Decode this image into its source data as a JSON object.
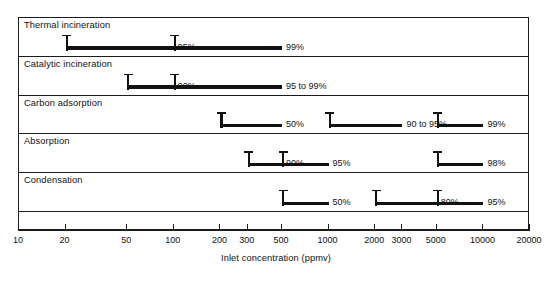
{
  "chart_data": {
    "type": "bar",
    "title": "",
    "xlabel": "Inlet concentration (ppmv)",
    "ylabel": "",
    "scale": "log",
    "xlim": [
      10,
      20000
    ],
    "grid": false,
    "legend": "none",
    "tick_labels": [
      "10",
      "20",
      "50",
      "100",
      "200",
      "300",
      "500",
      "1000",
      "2000",
      "3000",
      "5000",
      "10000",
      "20000"
    ],
    "tick_values": [
      10,
      20,
      50,
      100,
      200,
      300,
      500,
      1000,
      2000,
      3000,
      5000,
      10000,
      20000
    ],
    "categories": [
      "Thermal incineration",
      "Catalytic incineration",
      "Carbon adsorption",
      "Absorption",
      "Condensation"
    ],
    "series": [
      {
        "name": "Thermal incineration",
        "ranges": [
          {
            "label": "95%",
            "start": 20,
            "end": 100
          },
          {
            "label": "99%",
            "start": 100,
            "end": 500
          }
        ]
      },
      {
        "name": "Catalytic incineration",
        "ranges": [
          {
            "label": "90%",
            "start": 50,
            "end": 100
          },
          {
            "label": "95 to 99%",
            "start": 100,
            "end": 500
          }
        ]
      },
      {
        "name": "Carbon adsorption",
        "ranges": [
          {
            "label": "50%",
            "start": 200,
            "end": 500
          },
          {
            "label": "90 to 95%",
            "start": 1000,
            "end": 3000
          },
          {
            "label": "99%",
            "start": 5000,
            "end": 10000
          }
        ]
      },
      {
        "name": "Absorption",
        "ranges": [
          {
            "label": "90%",
            "start": 300,
            "end": 500
          },
          {
            "label": "95%",
            "start": 500,
            "end": 1000
          },
          {
            "label": "98%",
            "start": 5000,
            "end": 10000
          }
        ]
      },
      {
        "name": "Condensation",
        "ranges": [
          {
            "label": "50%",
            "start": 500,
            "end": 1000
          },
          {
            "label": "80%",
            "start": 2000,
            "end": 5000
          },
          {
            "label": "95%",
            "start": 5000,
            "end": 10000
          }
        ]
      }
    ]
  },
  "colors": {
    "line": "#1b1b1b",
    "marker": "#111111",
    "background": "#ffffff"
  }
}
